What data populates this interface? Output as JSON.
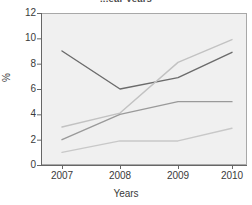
{
  "chart_data": {
    "type": "line",
    "title": "...ear years",
    "xlabel": "Years",
    "ylabel": "%",
    "categories": [
      "2007",
      "2008",
      "2009",
      "2010"
    ],
    "x": [
      2007,
      2008,
      2009,
      2010
    ],
    "ylim": [
      0,
      12
    ],
    "yticks": [
      0,
      2,
      4,
      6,
      8,
      10,
      12
    ],
    "ytick_labels": [
      "0",
      "2",
      "4",
      "6",
      "8",
      "10",
      "12"
    ],
    "grid": false,
    "legend": "none",
    "plot_background": "#f0f0f0",
    "series": [
      {
        "name": "series-1",
        "color": "#6b6b6b",
        "values": [
          9.0,
          6.0,
          6.9,
          8.9
        ]
      },
      {
        "name": "series-2",
        "color": "#c2c2c2",
        "values": [
          3.0,
          4.1,
          8.1,
          9.9
        ]
      },
      {
        "name": "series-3",
        "color": "#9a9a9a",
        "values": [
          2.0,
          4.0,
          5.0,
          5.0
        ]
      },
      {
        "name": "series-4",
        "color": "#c8c8c8",
        "values": [
          1.0,
          1.9,
          1.9,
          2.9
        ]
      }
    ]
  },
  "axes": {
    "y_title": "%",
    "x_title": "Years"
  }
}
